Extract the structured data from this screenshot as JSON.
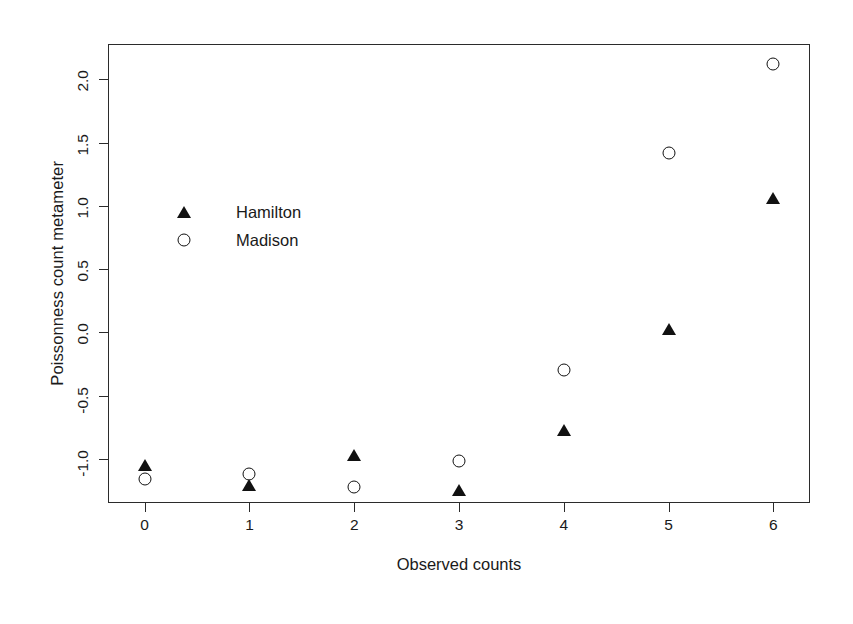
{
  "chart_data": {
    "type": "scatter",
    "title": "",
    "xlabel": "Observed counts",
    "ylabel": "Poissonness count metameter",
    "xlim": [
      -0.35,
      6.35
    ],
    "ylim": [
      -1.35,
      2.28
    ],
    "xticks": [
      0,
      1,
      2,
      3,
      4,
      5,
      6
    ],
    "xticklabels": [
      "0",
      "1",
      "2",
      "3",
      "4",
      "5",
      "6"
    ],
    "yticks": [
      -1.0,
      -0.5,
      0.0,
      0.5,
      1.0,
      1.5,
      2.0
    ],
    "yticklabels": [
      "-1.0",
      "-0.5",
      "0.0",
      "0.5",
      "1.0",
      "1.5",
      "2.0"
    ],
    "grid": false,
    "legend_position": "upper left inside",
    "x": [
      0,
      1,
      2,
      3,
      4,
      5,
      6
    ],
    "series": [
      {
        "name": "Hamilton",
        "marker": "filled-triangle",
        "color": "#111111",
        "values": [
          -1.05,
          -1.21,
          -0.97,
          -1.25,
          -0.77,
          0.03,
          1.06
        ]
      },
      {
        "name": "Madison",
        "marker": "open-circle",
        "color": "#111111",
        "values": [
          -1.16,
          -1.12,
          -1.22,
          -1.02,
          -0.3,
          1.42,
          2.12
        ]
      }
    ]
  }
}
